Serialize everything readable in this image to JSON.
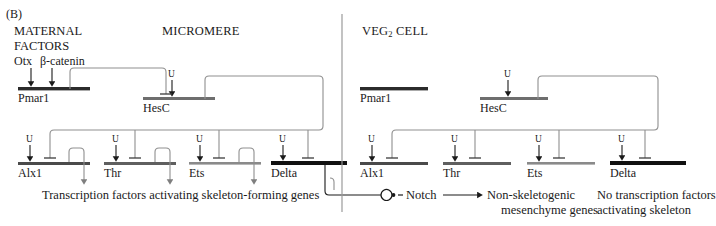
{
  "figure": {
    "panel_label": "(B)"
  },
  "left_panel": {
    "maternal_factors_line1": "MATERNAL",
    "maternal_factors_line2": "FACTORS",
    "title": "MICROMERE",
    "inputs": {
      "otx": "Otx",
      "beta_catenin": "β-catenin"
    },
    "genes": [
      {
        "name": "Pmar1",
        "color": "#2b2b2b",
        "state": "active"
      },
      {
        "name": "HesC",
        "color": "#6e6e6e",
        "state": "repressed"
      },
      {
        "name": "Alx1",
        "color": "#4a4a4a",
        "state": "active"
      },
      {
        "name": "Thr",
        "color": "#5f5f5f",
        "state": "active"
      },
      {
        "name": "Ets",
        "color": "#8a8a8a",
        "state": "active"
      },
      {
        "name": "Delta",
        "color": "#111111",
        "state": "active"
      }
    ],
    "ubiquitous_label": "U",
    "caption": "Transcription factors activating skeleton-forming genes"
  },
  "right_panel": {
    "title_main": "VEG",
    "title_sub": "2",
    "title_tail": " CELL",
    "genes": [
      {
        "name": "Pmar1",
        "color": "#2b2b2b",
        "state": "silent"
      },
      {
        "name": "HesC",
        "color": "#6e6e6e",
        "state": "active"
      },
      {
        "name": "Alx1",
        "color": "#4a4a4a",
        "state": "repressed"
      },
      {
        "name": "Thr",
        "color": "#5f5f5f",
        "state": "repressed"
      },
      {
        "name": "Ets",
        "color": "#8a8a8a",
        "state": "repressed"
      },
      {
        "name": "Delta",
        "color": "#111111",
        "state": "repressed"
      }
    ],
    "ubiquitous_label": "U",
    "caption_line1": "No transcription factors",
    "caption_line2": "activating skeleton"
  },
  "signaling": {
    "receptor_label": "Notch",
    "target_line1": "Non-skeletogenic",
    "target_line2": "mesenchyme genes"
  },
  "colors": {
    "wire": "#8f8f8f",
    "arrow": "#1a1a1a",
    "divider": "#9a9a9a",
    "text": "#1a1a1a"
  }
}
